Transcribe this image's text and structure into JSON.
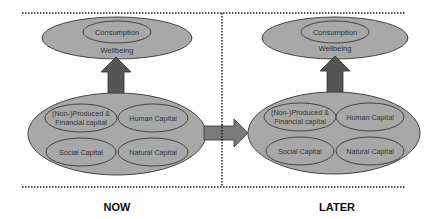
{
  "diagram": {
    "colors": {
      "ellipse_fill": "#a8a8a8",
      "ellipse_stroke": "#444444",
      "arrow_up_fill": "#555555",
      "arrow_right_fill": "#7a7a7a",
      "divider": "#222222"
    },
    "panels": [
      {
        "id": "now",
        "label": "NOW",
        "wellbeing": {
          "title": "Wellbeing",
          "inner": "Consumption"
        },
        "capitals": {
          "produced_line1": "(Non-)Produced &",
          "produced_line2": "Financial capital",
          "human": "Human Capital",
          "social": "Social Capital",
          "natural": "Natural Capital"
        }
      },
      {
        "id": "later",
        "label": "LATER",
        "wellbeing": {
          "title": "Wellbeing",
          "inner": "Consumption"
        },
        "capitals": {
          "produced_line1": "(Non-)Produced &",
          "produced_line2": "Financial capital",
          "human": "Human Capital",
          "social": "Social Capital",
          "natural": "Natural Capital"
        }
      }
    ],
    "flows": [
      {
        "from": "now.capitals",
        "to": "now.wellbeing",
        "direction": "up"
      },
      {
        "from": "now.capitals",
        "to": "later.capitals",
        "direction": "right"
      },
      {
        "from": "later.capitals",
        "to": "later.wellbeing",
        "direction": "up"
      }
    ]
  }
}
